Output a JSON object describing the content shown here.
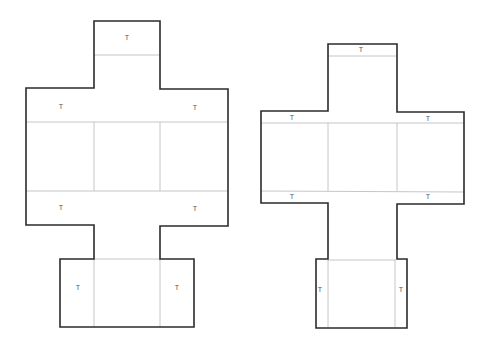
{
  "diagram": {
    "type": "box-net-templates",
    "colors": {
      "cut_line": "#2b2b2b",
      "fold_line": "#b8b8b8",
      "label": "#555555",
      "background": "#ffffff"
    },
    "nets": [
      {
        "name": "net-large",
        "tab_label": "T",
        "tabs": [
          {
            "id": "top",
            "label": "T",
            "x": 127,
            "y": 38
          },
          {
            "id": "left-upper",
            "label": "T",
            "x": 61,
            "y": 107
          },
          {
            "id": "right-upper",
            "label": "T",
            "x": 195,
            "y": 108
          },
          {
            "id": "left-lower",
            "label": "T",
            "x": 61,
            "y": 208
          },
          {
            "id": "right-lower",
            "label": "T",
            "x": 195,
            "y": 209
          },
          {
            "id": "bottom-left",
            "label": "T",
            "x": 78,
            "y": 288
          },
          {
            "id": "bottom-right",
            "label": "T",
            "x": 177,
            "y": 288
          }
        ]
      },
      {
        "name": "net-small",
        "tab_label": "T",
        "tabs": [
          {
            "id": "top",
            "label": "T",
            "x": 361,
            "y": 50
          },
          {
            "id": "left-upper",
            "label": "T",
            "x": 292,
            "y": 118
          },
          {
            "id": "right-upper",
            "label": "T",
            "x": 428,
            "y": 119
          },
          {
            "id": "left-lower",
            "label": "T",
            "x": 292,
            "y": 197
          },
          {
            "id": "right-lower",
            "label": "T",
            "x": 428,
            "y": 197
          },
          {
            "id": "bottom-left",
            "label": "T",
            "x": 320,
            "y": 290
          },
          {
            "id": "bottom-right",
            "label": "T",
            "x": 401,
            "y": 290
          }
        ]
      }
    ]
  }
}
